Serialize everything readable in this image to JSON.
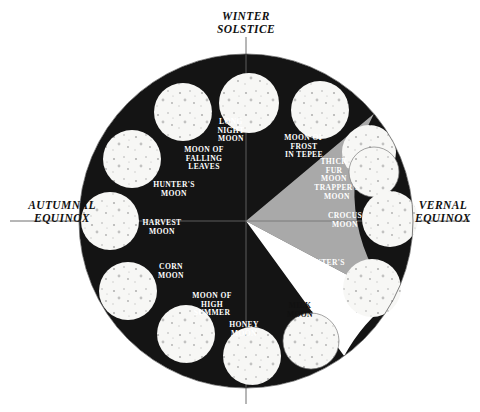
{
  "figure": {
    "kind": "moon-calendar-wheel",
    "background_color": "#ffffff",
    "outer_circle": {
      "cx": 246,
      "cy": 221,
      "r": 167
    }
  },
  "colors": {
    "night": "#141414",
    "spring_gray": "#a9a9a9",
    "white_wedge": "#ffffff",
    "moon_disc": "#f7f7f5",
    "moon_speckle": "#8d8d8d",
    "axis": "#4a4a4a",
    "text_dark": "#111111",
    "text_light": "#ffffff"
  },
  "season_markers": [
    {
      "id": "winter-solstice",
      "lines": [
        "WINTER",
        "SOLSTICE"
      ],
      "x": 246,
      "y": 20,
      "anchor": "middle"
    },
    {
      "id": "autumnal-equinox",
      "lines": [
        "AUTUMNAL",
        "EQUINOX"
      ],
      "x": 62,
      "y": 209,
      "anchor": "middle"
    },
    {
      "id": "vernal-equinox",
      "lines": [
        "VERNAL",
        "EQUINOX"
      ],
      "x": 443,
      "y": 209,
      "anchor": "middle"
    }
  ],
  "axis_lines": [
    {
      "id": "vertical-axis",
      "x1": 246,
      "y1": 37,
      "x2": 246,
      "y2": 404
    },
    {
      "id": "horizontal-axis",
      "x1": 10,
      "y1": 221,
      "x2": 470,
      "y2": 221
    }
  ],
  "sectors": [
    {
      "id": "night-sector",
      "fill": "#141414",
      "start_deg": 40,
      "end_deg": 320,
      "label": "dark season"
    },
    {
      "id": "spring-gray-sector",
      "fill": "#a9a9a9",
      "start_deg": -28,
      "end_deg": 40,
      "label": "gray season"
    },
    {
      "id": "white-wedge-sector",
      "fill": "#ffffff",
      "start_deg": -54,
      "end_deg": -28,
      "label": "white wedge"
    }
  ],
  "moons": [
    {
      "id": "long-night-moon",
      "label_lines": [
        "LONG",
        "NIGHT",
        "MOON"
      ],
      "label_x": 231,
      "label_y": 124,
      "label_anchor": "middle",
      "label_tone": "on-dark",
      "disc": {
        "cx": 249,
        "cy": 103,
        "r": 30,
        "outlined": false
      }
    },
    {
      "id": "moon-of-frost-in-tepee",
      "label_lines": [
        "MOON OF",
        "FROST",
        "IN TEPEE"
      ],
      "label_x": 304,
      "label_y": 140,
      "label_anchor": "middle",
      "label_tone": "on-dark",
      "disc": {
        "cx": 320,
        "cy": 110,
        "r": 29,
        "outlined": false
      }
    },
    {
      "id": "thick-fur-moon",
      "label_lines": [
        "THICK",
        "FUR",
        "MOON"
      ],
      "label_x": 334,
      "label_y": 164,
      "label_anchor": "middle",
      "label_tone": "on-dark",
      "disc": {
        "cx": 369,
        "cy": 152,
        "r": 27,
        "outlined": false
      }
    },
    {
      "id": "trappers-moon",
      "label_lines": [
        "TRAPPER'S",
        "MOON"
      ],
      "label_x": 337,
      "label_y": 190,
      "label_anchor": "middle",
      "label_tone": "on-light",
      "disc": {
        "cx": 374,
        "cy": 172,
        "r": 25,
        "outlined": true
      }
    },
    {
      "id": "crocus-moon",
      "label_lines": [
        "CROCUS",
        "MOON"
      ],
      "label_x": 345,
      "label_y": 218,
      "label_anchor": "middle",
      "label_tone": "on-light",
      "disc": {
        "cx": 390,
        "cy": 219,
        "r": 28,
        "outlined": false
      }
    },
    {
      "id": "planters-moon",
      "label_lines": [
        "PLANTER'S",
        "MOON"
      ],
      "label_x": 322,
      "label_y": 265,
      "label_anchor": "middle",
      "label_tone": "on-light",
      "disc": {
        "cx": 372,
        "cy": 288,
        "r": 29,
        "outlined": false
      }
    },
    {
      "id": "milk-moon",
      "label_lines": [
        "MILK",
        "MOON"
      ],
      "label_x": 300,
      "label_y": 308,
      "label_anchor": "middle",
      "label_tone": "on-white",
      "disc": {
        "cx": 311,
        "cy": 341,
        "r": 28,
        "outlined": true
      }
    },
    {
      "id": "honey-moon",
      "label_lines": [
        "HONEY",
        "MOON"
      ],
      "label_x": 244,
      "label_y": 327,
      "label_anchor": "middle",
      "label_tone": "on-dark",
      "disc": {
        "cx": 252,
        "cy": 356,
        "r": 29,
        "outlined": false
      }
    },
    {
      "id": "moon-of-high-summer",
      "label_lines": [
        "MOON OF",
        "HIGH",
        "SUMMER"
      ],
      "label_x": 212,
      "label_y": 298,
      "label_anchor": "middle",
      "label_tone": "on-dark",
      "disc": {
        "cx": 186,
        "cy": 334,
        "r": 29,
        "outlined": false
      }
    },
    {
      "id": "corn-moon",
      "label_lines": [
        "CORN",
        "MOON"
      ],
      "label_x": 171,
      "label_y": 269,
      "label_anchor": "middle",
      "label_tone": "on-dark",
      "disc": {
        "cx": 128,
        "cy": 291,
        "r": 29,
        "outlined": false
      }
    },
    {
      "id": "harvest-moon",
      "label_lines": [
        "HARVEST",
        "MOON"
      ],
      "label_x": 162,
      "label_y": 225,
      "label_anchor": "middle",
      "label_tone": "on-dark",
      "disc": {
        "cx": 110,
        "cy": 221,
        "r": 29,
        "outlined": false
      }
    },
    {
      "id": "hunters-moon",
      "label_lines": [
        "HUNTER'S",
        "MOON"
      ],
      "label_x": 174,
      "label_y": 187,
      "label_anchor": "middle",
      "label_tone": "on-dark",
      "disc": {
        "cx": 132,
        "cy": 159,
        "r": 29,
        "outlined": false
      }
    },
    {
      "id": "moon-of-falling-leaves",
      "label_lines": [
        "MOON OF",
        "FALLING",
        "LEAVES"
      ],
      "label_x": 204,
      "label_y": 152,
      "label_anchor": "middle",
      "label_tone": "on-dark",
      "disc": {
        "cx": 183,
        "cy": 112,
        "r": 29,
        "outlined": false
      }
    }
  ]
}
